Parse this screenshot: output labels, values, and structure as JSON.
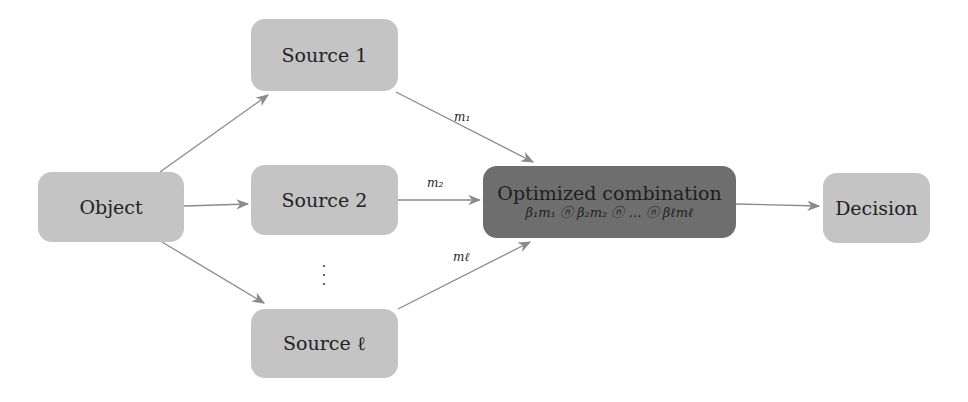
{
  "diagram": {
    "nodes": {
      "object": "Object",
      "source1": "Source 1",
      "source2": "Source 2",
      "sourceL": "Source ℓ",
      "combination_title": "Optimized combination",
      "combination_formula": "β₁m₁ ⓝ β₂m₂ ⓝ … ⓝ βℓmℓ",
      "decision": "Decision"
    },
    "edge_labels": {
      "m1": "m₁",
      "m2": "m₂",
      "mL": "mℓ"
    },
    "ellipsis": "⋮",
    "colors": {
      "node_fill": "#c4c4c4",
      "combination_fill": "#6e6e6e",
      "edge": "#8a8a8a"
    }
  }
}
